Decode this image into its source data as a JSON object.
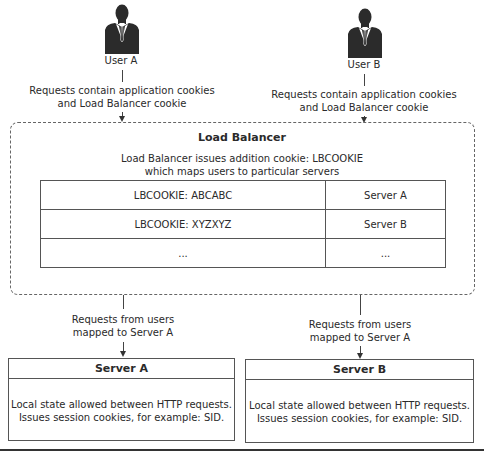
{
  "users": [
    {
      "label": "User A",
      "icon": "person-icon",
      "request_note": [
        "Requests contain application cookies",
        "and Load Balancer cookie"
      ]
    },
    {
      "label": "User B",
      "icon": "person-icon",
      "request_note": [
        "Requests contain application cookies",
        "and Load Balancer cookie"
      ]
    }
  ],
  "load_balancer": {
    "title": "Load Balancer",
    "description": [
      "Load Balancer issues addition cookie: LBCOOKIE",
      "which maps users to particular servers"
    ],
    "mapping_table": [
      {
        "cookie": "LBCOOKIE: ABCABC",
        "server": "Server A"
      },
      {
        "cookie": "LBCOOKIE: XYZXYZ",
        "server": "Server B"
      },
      {
        "cookie": "...",
        "server": "..."
      }
    ]
  },
  "routes": [
    {
      "note": [
        "Requests from users",
        "mapped to Server A"
      ]
    },
    {
      "note": [
        "Requests from users",
        "mapped to Server A"
      ]
    }
  ],
  "servers": [
    {
      "title": "Server A",
      "description": [
        "Local state allowed between HTTP requests.",
        "Issues session cookies, for example: SID."
      ]
    },
    {
      "title": "Server B",
      "description": [
        "Local state allowed between HTTP requests.",
        "Issues session cookies, for example: SID."
      ]
    }
  ],
  "colors": {
    "icon": "#2b2b2b",
    "line": "#444444",
    "text": "#2a2a2a"
  }
}
